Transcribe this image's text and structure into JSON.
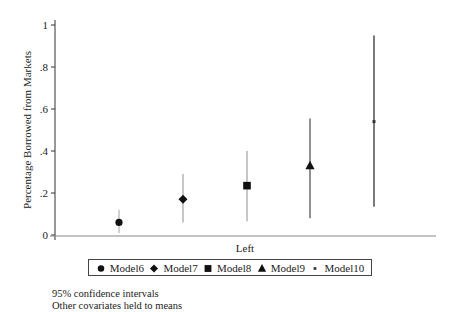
{
  "chart_data": {
    "type": "scatter",
    "subtype": "point-estimate-with-confidence-intervals",
    "title": "",
    "xlabel": "Left",
    "ylabel": "Percentage Borrowed from Markets",
    "ylim": [
      0,
      1
    ],
    "yticks": [
      0,
      0.2,
      0.4,
      0.6,
      0.8,
      1
    ],
    "ytick_labels": [
      "0",
      ".2",
      ".4",
      ".6",
      ".8",
      "1"
    ],
    "grid": false,
    "legend_position": "bottom",
    "series": [
      {
        "name": "Model6",
        "marker": "circle",
        "value": 0.06,
        "ci_low": 0.01,
        "ci_high": 0.12
      },
      {
        "name": "Model7",
        "marker": "diamond",
        "value": 0.17,
        "ci_low": 0.06,
        "ci_high": 0.29
      },
      {
        "name": "Model8",
        "marker": "square",
        "value": 0.235,
        "ci_low": 0.065,
        "ci_high": 0.4
      },
      {
        "name": "Model9",
        "marker": "triangle",
        "value": 0.33,
        "ci_low": 0.08,
        "ci_high": 0.555
      },
      {
        "name": "Model10",
        "marker": "x-small",
        "value": 0.54,
        "ci_low": 0.135,
        "ci_high": 0.95
      }
    ],
    "notes": [
      "95% confidence intervals",
      "Other covariates held to means"
    ]
  },
  "legend": {
    "items": [
      {
        "label": "Model6",
        "marker": "circle"
      },
      {
        "label": "Model7",
        "marker": "diamond"
      },
      {
        "label": "Model8",
        "marker": "square"
      },
      {
        "label": "Model9",
        "marker": "triangle"
      },
      {
        "label": "Model10",
        "marker": "x-small"
      }
    ]
  },
  "notes": {
    "line1": "95% confidence intervals",
    "line2": "Other covariates held to means"
  }
}
